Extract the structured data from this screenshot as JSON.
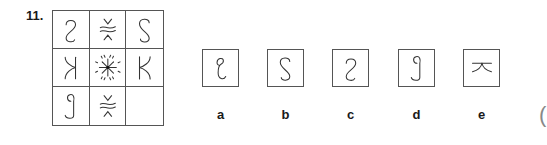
{
  "question": {
    "number": "11.",
    "grid": {
      "rows": 3,
      "cols": 3,
      "cells": [
        [
          "reversed-s-hook",
          "wave-with-chevrons",
          "s-hook"
        ],
        [
          "reversed-k",
          "starburst",
          "k"
        ],
        [
          "g-hook",
          "wave-with-chevrons",
          "empty"
        ]
      ]
    },
    "options": [
      {
        "label": "a",
        "glyph": "c-hook-loop"
      },
      {
        "label": "b",
        "glyph": "s-hook"
      },
      {
        "label": "c",
        "glyph": "reversed-s-hook"
      },
      {
        "label": "d",
        "glyph": "g-hook"
      },
      {
        "label": "e",
        "glyph": "bar-with-chevron"
      }
    ],
    "trailing_text": "("
  },
  "colors": {
    "line": "#333333",
    "border": "#555555",
    "background": "#ffffff"
  }
}
